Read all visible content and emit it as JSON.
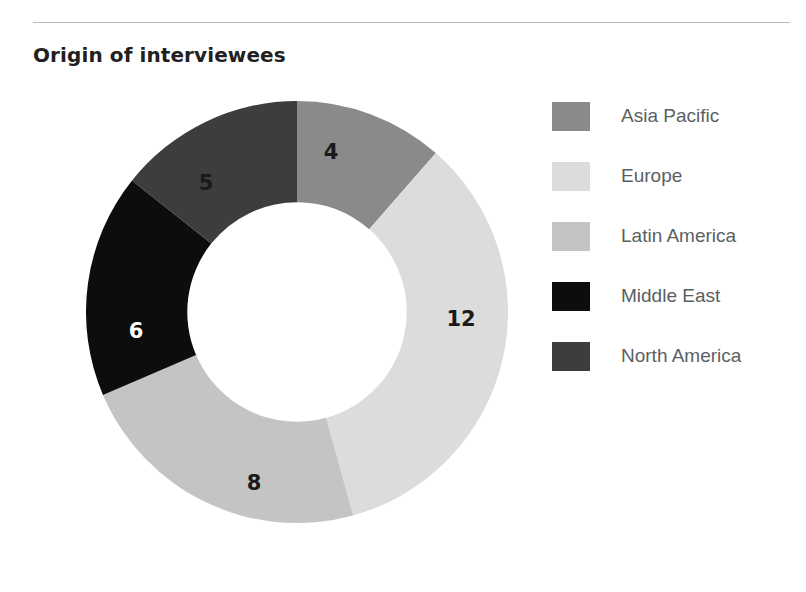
{
  "page": {
    "title": "Origin of interviewees",
    "background": "#ffffff",
    "rule_color": "#b9bcbe"
  },
  "chart_data": {
    "type": "pie",
    "variant": "donut",
    "title": "Origin of interviewees",
    "xlabel": "",
    "ylabel": "",
    "total": 35,
    "start_angle_deg": 0,
    "direction": "clockwise",
    "inner_radius_ratio": 0.52,
    "legend_position": "right",
    "grid": false,
    "categories": [
      "Asia Pacific",
      "Europe",
      "Latin America",
      "Middle East",
      "North America"
    ],
    "values": [
      4,
      12,
      8,
      6,
      5
    ],
    "slices": [
      {
        "label": "Asia Pacific",
        "value": 4,
        "value_text": "4",
        "color": "#8a8a8a",
        "label_color": "#1a1a1a",
        "start_deg": 0,
        "end_deg": 41.14,
        "label_x": 331,
        "label_y": 152
      },
      {
        "label": "Europe",
        "value": 12,
        "value_text": "12",
        "color": "#dcdcdc",
        "label_color": "#1a1a1a",
        "start_deg": 41.14,
        "end_deg": 164.57,
        "label_x": 461,
        "label_y": 319
      },
      {
        "label": "Latin America",
        "value": 8,
        "value_text": "8",
        "color": "#c4c4c4",
        "label_color": "#1a1a1a",
        "start_deg": 164.57,
        "end_deg": 246.86,
        "label_x": 254,
        "label_y": 483
      },
      {
        "label": "Middle East",
        "value": 6,
        "value_text": "6",
        "color": "#0d0d0d",
        "label_color": "#ffffff",
        "start_deg": 246.86,
        "end_deg": 308.57,
        "label_x": 136,
        "label_y": 331
      },
      {
        "label": "North America",
        "value": 5,
        "value_text": "5",
        "color": "#3d3d3d",
        "label_color": "#1a1a1a",
        "start_deg": 308.57,
        "end_deg": 360,
        "label_x": 206,
        "label_y": 183
      }
    ]
  },
  "legend": {
    "items": [
      {
        "label": "Asia Pacific",
        "color": "#8a8a8a"
      },
      {
        "label": "Europe",
        "color": "#dcdcdc"
      },
      {
        "label": "Latin America",
        "color": "#c4c4c4"
      },
      {
        "label": "Middle East",
        "color": "#0d0d0d"
      },
      {
        "label": "North America",
        "color": "#3d3d3d"
      }
    ]
  }
}
